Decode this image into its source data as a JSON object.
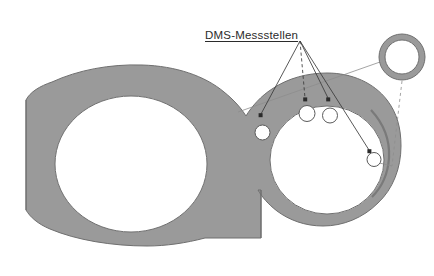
{
  "figure": {
    "kind": "technical-cross-section-drawing",
    "background_color": "#ffffff",
    "body_fill_color": "#9a9a9a",
    "body_edge_color": "#6f6f6f",
    "measurement_point_fill": "#ffffff",
    "measurement_point_edge": "#5a5a5a",
    "leader_line_color": "#3a3a3a",
    "thin_line_color": "#8d8d8d",
    "label_color": "#2b2b2b"
  },
  "annotations": {
    "title_label": "DMS-Messstellen",
    "title_position": {
      "x": 205,
      "y": 30
    }
  },
  "leader_origin": {
    "x": 300,
    "y": 41
  },
  "measurement_points": [
    {
      "id": "mp-1",
      "x": 262.5,
      "y": 132.5,
      "r": 7.5,
      "arrow_tip": {
        "x": 261,
        "y": 116
      }
    },
    {
      "id": "mp-2",
      "x": 307,
      "y": 113.5,
      "r": 8.0,
      "arrow_tip": {
        "x": 305,
        "y": 100
      }
    },
    {
      "id": "mp-3",
      "x": 330,
      "y": 115.5,
      "r": 7.5,
      "arrow_tip": {
        "x": 328,
        "y": 100
      }
    },
    {
      "id": "mp-4",
      "x": 374,
      "y": 159.5,
      "r": 7.0,
      "arrow_tip": {
        "x": 370,
        "y": 152
      }
    }
  ],
  "detail_callout": {
    "id": "detail-ring",
    "center": {
      "x": 402,
      "y": 57
    },
    "outer_r": 23,
    "inner_r": 17,
    "ring_color": "#9a9a9a",
    "ring_edge_color": "#6f6f6f"
  },
  "connector_lines": {
    "detail_to_body_diagonal": {
      "x1": 380,
      "y1": 62,
      "x2": 238,
      "y2": 112
    },
    "detail_dashed_drop": {
      "x1": 402,
      "y1": 81,
      "x2": 392,
      "y2": 166
    },
    "detail_foot_horizontal": {
      "x1": 392,
      "y1": 166,
      "x2": 372,
      "y2": 161
    }
  },
  "geometry": {
    "big_eye": {
      "cx": 131,
      "cy": 164,
      "rx": 76,
      "ry": 68
    },
    "small_eye": {
      "cx": 327,
      "cy": 160,
      "rx": 57,
      "ry": 54
    },
    "parting_line": {
      "x": 261,
      "y1": 192,
      "y2": 238
    }
  }
}
